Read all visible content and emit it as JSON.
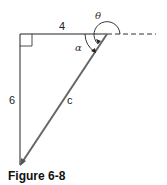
{
  "figure": {
    "caption": "Figure 6-8",
    "labels": {
      "top_side": "4",
      "left_side": "6",
      "hypotenuse": "c",
      "inner_angle": "α",
      "outer_angle": "θ"
    },
    "colors": {
      "line": "#222222",
      "hypotenuse": "#555555",
      "dashed": "#333333"
    }
  }
}
